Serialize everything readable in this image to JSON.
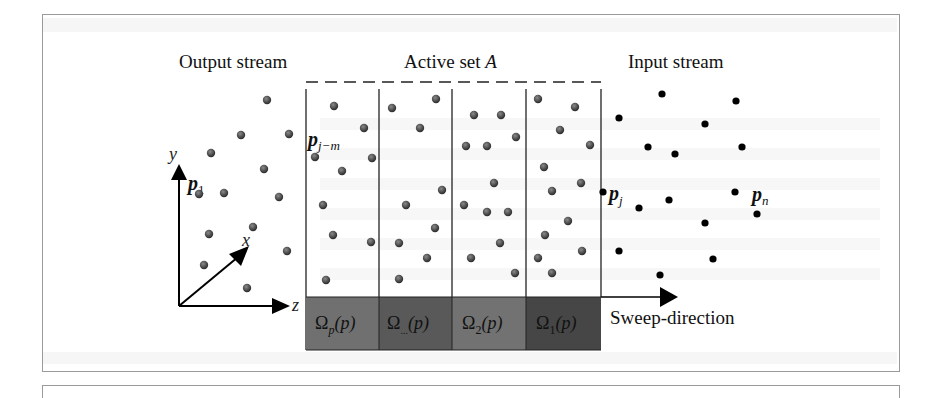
{
  "figure": {
    "labels": {
      "output_stream": "Output stream",
      "active_set": "Active set ",
      "active_set_var": "A",
      "input_stream": "Input stream",
      "sweep_direction": "Sweep-direction"
    },
    "point_labels": {
      "p1_base": "p",
      "p1_sub": "1",
      "pjm_base": "p",
      "pjm_sub": "j−m",
      "pj_base": "p",
      "pj_sub": "j",
      "pn_base": "p",
      "pn_sub": "n"
    },
    "axes": {
      "x": "x",
      "y": "y",
      "z": "z"
    },
    "omega_blocks": [
      {
        "label": "Ω",
        "sub": "p",
        "arg": "(p)",
        "color": "#6f6f6f"
      },
      {
        "label": "Ω",
        "sub": "...",
        "arg": "(p)",
        "color": "#585858"
      },
      {
        "label": "Ω",
        "sub": "2",
        "arg": "(p)",
        "color": "#707070"
      },
      {
        "label": "Ω",
        "sub": "1",
        "arg": "(p)",
        "color": "#444444"
      }
    ],
    "colors": {
      "processed_dot": "#555555",
      "input_dot": "#000000",
      "frame": "#999999"
    }
  }
}
